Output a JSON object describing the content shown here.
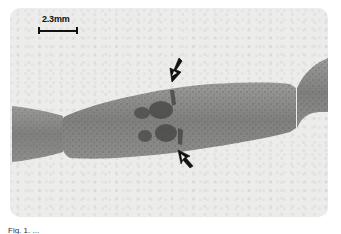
{
  "figure": {
    "scale_bar": {
      "label": "2.3mm"
    },
    "annotations": [
      {
        "type": "arrow",
        "name": "upper-arrow",
        "direction": "down-left"
      },
      {
        "type": "arrow",
        "name": "lower-arrow",
        "direction": "up-left"
      }
    ],
    "caption": "Fig. 1. ...",
    "colors": {
      "background": "#ffffff",
      "plate": "#ececea",
      "specimen_body": "#8a8a88",
      "specimen_dark_patches": "#4a4a48",
      "arrows": "#111111"
    }
  }
}
